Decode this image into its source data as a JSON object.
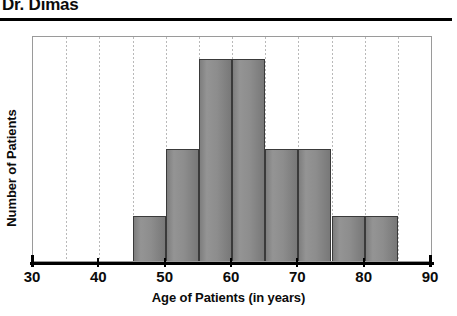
{
  "header": {
    "title": "Dr. Dimas"
  },
  "chart_data": {
    "type": "bar",
    "title": "",
    "xlabel": "Age of Patients (in years)",
    "ylabel": "Number of Patients",
    "xlim": [
      30,
      90
    ],
    "ylim": [
      0,
      10
    ],
    "bin_width": 5,
    "grid": true,
    "grid_axis": "x",
    "legend": "none",
    "bar_color": "#8d8d8d",
    "bar_edge_color": "#3a3a3a",
    "axis_color": "#000000",
    "xticks": [
      30,
      40,
      50,
      60,
      70,
      80,
      90
    ],
    "xtick_labels": [
      "30",
      "40",
      "50",
      "60",
      "70",
      "80",
      "90"
    ],
    "gridline_positions": [
      35,
      40,
      45,
      50,
      55,
      60,
      65,
      70,
      75,
      80,
      85
    ],
    "yticks": [],
    "ytick_labels": [],
    "bins": [
      {
        "start": 45,
        "end": 50,
        "value": 2
      },
      {
        "start": 50,
        "end": 55,
        "value": 5
      },
      {
        "start": 55,
        "end": 60,
        "value": 9
      },
      {
        "start": 60,
        "end": 65,
        "value": 9
      },
      {
        "start": 65,
        "end": 70,
        "value": 5
      },
      {
        "start": 70,
        "end": 75,
        "value": 5
      },
      {
        "start": 75,
        "end": 80,
        "value": 2
      },
      {
        "start": 80,
        "end": 85,
        "value": 2
      }
    ],
    "categories": [
      "45-50",
      "50-55",
      "55-60",
      "60-65",
      "65-70",
      "70-75",
      "75-80",
      "80-85"
    ],
    "values": [
      2,
      5,
      9,
      9,
      5,
      5,
      2,
      2
    ]
  }
}
